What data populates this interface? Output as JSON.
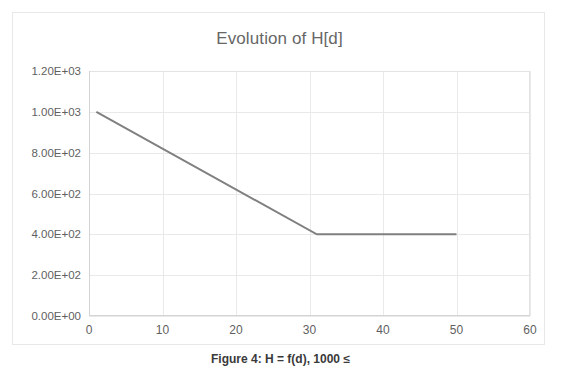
{
  "chart_data": {
    "type": "line",
    "title": "Evolution of H[d]",
    "xlabel": "",
    "ylabel": "",
    "xlim": [
      0,
      60
    ],
    "ylim": [
      0,
      1200
    ],
    "grid": true,
    "legend": false,
    "legend_position": "none",
    "x_ticks": [
      "0",
      "10",
      "20",
      "30",
      "40",
      "50",
      "60"
    ],
    "x_tick_values": [
      0,
      10,
      20,
      30,
      40,
      50,
      60
    ],
    "y_ticks": [
      "0.00E+00",
      "2.00E+02",
      "4.00E+02",
      "6.00E+02",
      "8.00E+02",
      "1.00E+03",
      "1.20E+03"
    ],
    "y_tick_values": [
      0,
      200,
      400,
      600,
      800,
      1000,
      1200
    ],
    "series": [
      {
        "name": "H[d]",
        "color": "#808080",
        "x": [
          1,
          31,
          50
        ],
        "values": [
          1000,
          400,
          400
        ]
      }
    ]
  },
  "chart": {
    "title": "Evolution of H[d]",
    "line_color": "#808080",
    "gridline_color": "#e9e9e9",
    "axis_color": "#d4d4d4",
    "text_color": "#5f5f5f",
    "border_color": "#e8e8e8"
  },
  "caption": {
    "text": "Figure 4: H = f(d), 1000 ≤"
  }
}
